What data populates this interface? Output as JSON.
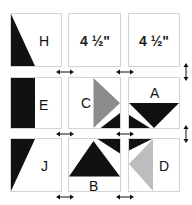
{
  "diagram": {
    "type": "quilt-block-layout",
    "colors": {
      "black": "#111111",
      "gray_dark": "#8c8c8c",
      "gray_light": "#bdbdbd",
      "border": "#d4d4d4",
      "background": "#ffffff"
    },
    "dimension_labels": [
      "4 ½\"",
      "4 ½\""
    ],
    "blocks": [
      {
        "row": 1,
        "col": 1,
        "label": "H"
      },
      {
        "row": 1,
        "col": 2,
        "label": "4 ½\""
      },
      {
        "row": 1,
        "col": 3,
        "label": "4 ½\""
      },
      {
        "row": 2,
        "col": 1,
        "label": "E"
      },
      {
        "row": 2,
        "col": 2,
        "label": "C"
      },
      {
        "row": 2,
        "col": 3,
        "label": "A"
      },
      {
        "row": 3,
        "col": 1,
        "label": "J"
      },
      {
        "row": 3,
        "col": 2,
        "label": "B"
      },
      {
        "row": 3,
        "col": 3,
        "label": "D"
      }
    ],
    "arrows": {
      "horizontal": [
        "double-arrow",
        "double-arrow",
        "double-arrow",
        "double-arrow",
        "double-arrow",
        "double-arrow"
      ],
      "vertical": [
        "double-arrow",
        "double-arrow"
      ]
    }
  }
}
